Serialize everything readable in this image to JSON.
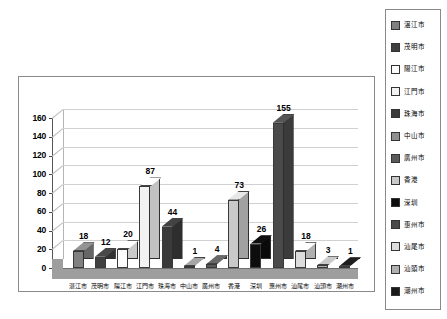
{
  "chart_data": {
    "type": "bar",
    "title": "",
    "subtitle": "",
    "xlabel": "",
    "ylabel": "",
    "ylim": [
      0,
      160
    ],
    "ytick_step": 20,
    "yticks": [
      "160",
      "140",
      "120",
      "100",
      "80",
      "60",
      "40",
      "20",
      "0"
    ],
    "grid": true,
    "legend_position": "right",
    "style": "3d-column",
    "categories": [
      "湛江市",
      "茂明市",
      "陽江市",
      "江門市",
      "珠海市",
      "中山市",
      "廣州市",
      "香港",
      "深圳",
      "惠州市",
      "汕尾市",
      "汕頭市",
      "潮州市"
    ],
    "values": [
      18,
      12,
      20,
      87,
      44,
      1,
      4,
      73,
      26,
      155,
      18,
      3,
      1
    ],
    "bar_colors": [
      "#808080",
      "#3f3f3f",
      "#fdfdfd",
      "#f2f2f2",
      "#3a3a3a",
      "#909090",
      "#5a5a5a",
      "#c9c9c9",
      "#0d0d0d",
      "#4a4a4a",
      "#dcdcdc",
      "#b0b0b0",
      "#1a1a1a"
    ]
  },
  "legend": {
    "items": [
      {
        "label": "湛江市",
        "color": "#808080"
      },
      {
        "label": "茂明市",
        "color": "#3f3f3f"
      },
      {
        "label": "陽江市",
        "color": "#fdfdfd"
      },
      {
        "label": "江門市",
        "color": "#f2f2f2"
      },
      {
        "label": "珠海市",
        "color": "#3a3a3a"
      },
      {
        "label": "中山市",
        "color": "#909090"
      },
      {
        "label": "廣州市",
        "color": "#5a5a5a"
      },
      {
        "label": "香港",
        "color": "#c9c9c9"
      },
      {
        "label": "深圳",
        "color": "#0d0d0d"
      },
      {
        "label": "惠州市",
        "color": "#4a4a4a"
      },
      {
        "label": "汕尾市",
        "color": "#dcdcdc"
      },
      {
        "label": "汕頭市",
        "color": "#b0b0b0"
      },
      {
        "label": "潮州市",
        "color": "#1a1a1a"
      }
    ]
  }
}
